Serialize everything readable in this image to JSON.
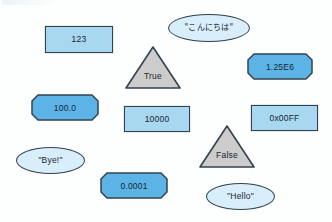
{
  "diagram": {
    "background_color": "#fdfefe",
    "colors": {
      "rect_fill": "#a8d8f0",
      "octagon_fill": "#5bb4e5",
      "ellipse_fill": "#d8eefa",
      "triangle_fill": "#cccccc",
      "border": "#34424f",
      "text": "#1a2430"
    },
    "nodes": [
      {
        "id": "int-123",
        "label": "123",
        "shape": "rectangle",
        "x": 45,
        "y": 26,
        "width": 68,
        "height": 27
      },
      {
        "id": "string-konnichiwa",
        "label": "\"こんにちは\"",
        "shape": "ellipse",
        "x": 168,
        "y": 14,
        "width": 82,
        "height": 28
      },
      {
        "id": "bool-true",
        "label": "True",
        "shape": "triangle",
        "x": 124,
        "y": 45,
        "width": 58,
        "height": 45
      },
      {
        "id": "float-1-25e6",
        "label": "1.25E6",
        "shape": "octagon",
        "x": 247,
        "y": 53,
        "width": 66,
        "height": 27
      },
      {
        "id": "float-100",
        "label": "100.0",
        "shape": "octagon",
        "x": 31,
        "y": 94,
        "width": 68,
        "height": 27
      },
      {
        "id": "int-10000",
        "label": "10000",
        "shape": "rectangle",
        "x": 124,
        "y": 106,
        "width": 66,
        "height": 26
      },
      {
        "id": "hex-0x00ff",
        "label": "0x00FF",
        "shape": "rectangle",
        "x": 251,
        "y": 105,
        "width": 67,
        "height": 26
      },
      {
        "id": "bool-false",
        "label": "False",
        "shape": "triangle",
        "x": 198,
        "y": 124,
        "width": 58,
        "height": 45
      },
      {
        "id": "string-bye",
        "label": "\"Bye!\"",
        "shape": "ellipse",
        "x": 16,
        "y": 147,
        "width": 69,
        "height": 27
      },
      {
        "id": "float-0-0001",
        "label": "0.0001",
        "shape": "octagon",
        "x": 100,
        "y": 172,
        "width": 68,
        "height": 27
      },
      {
        "id": "string-hello",
        "label": "\"Hello\"",
        "shape": "ellipse",
        "x": 206,
        "y": 183,
        "width": 69,
        "height": 27
      }
    ]
  }
}
